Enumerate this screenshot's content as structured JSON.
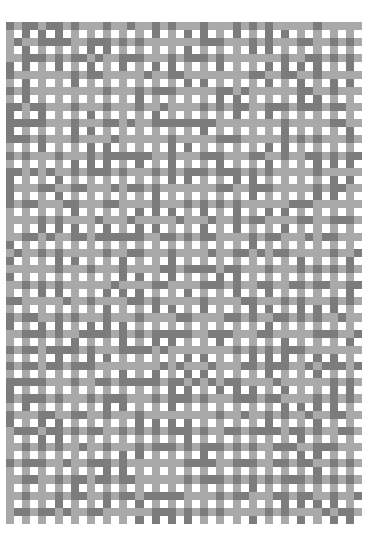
{
  "image": {
    "description": "Woven textile pattern of light and dark grey bands with white gaps",
    "colors": {
      "background": "#ffffff",
      "light": "#a9a9a9",
      "dark": "#7c7c7c",
      "gap": "#ffffff"
    },
    "grid": {
      "cols": 44,
      "rows": 62,
      "cell": 8.1
    }
  }
}
